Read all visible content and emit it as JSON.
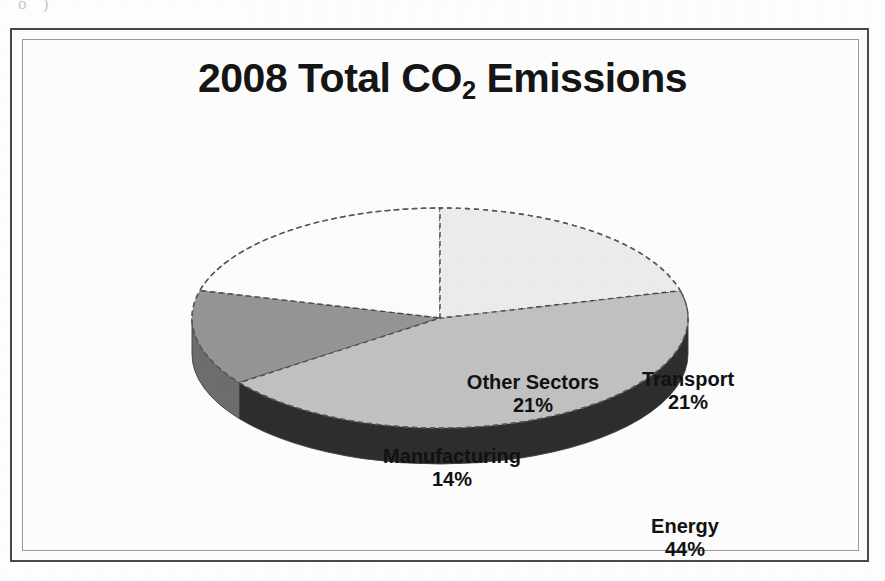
{
  "document": {
    "scan_artifact_top": "o          )"
  },
  "chart": {
    "title_main": "2008 Total CO",
    "title_sub": "2",
    "title_tail": " Emissions",
    "title_plain": "2008 Total CO2 Emissions"
  },
  "chart_data": {
    "type": "pie",
    "title": "2008 Total CO2 Emissions",
    "xlabel": "",
    "ylabel": "",
    "legend": "none",
    "grid": false,
    "three_d": true,
    "start_angle_deg": 0,
    "direction": "clockwise",
    "categories": [
      "Transport",
      "Energy",
      "Manufacturing",
      "Other Sectors"
    ],
    "values": [
      21,
      44,
      14,
      21
    ],
    "unit": "%",
    "slices": [
      {
        "label": "Transport",
        "value": 21,
        "value_text": "21%",
        "color": "#ededed",
        "side_color": "#b4b4b4"
      },
      {
        "label": "Energy",
        "value": 44,
        "value_text": "44%",
        "color": "#c2c2c2",
        "side_color": "#2e2e2e"
      },
      {
        "label": "Manufacturing",
        "value": 14,
        "value_text": "14%",
        "color": "#969696",
        "side_color": "#6e6e6e"
      },
      {
        "label": "Other Sectors",
        "value": 21,
        "value_text": "21%",
        "color": "#fdfdfd",
        "side_color": "#9e9e9e"
      }
    ]
  },
  "labels": {
    "other_sectors": {
      "name": "Other Sectors",
      "value": "21%"
    },
    "transport": {
      "name": "Transport",
      "value": "21%"
    },
    "manufacturing": {
      "name": "Manufacturing",
      "value": "14%"
    },
    "energy": {
      "name": "Energy",
      "value": "44%"
    }
  },
  "colors": {
    "page_background": "#ffffff",
    "frame_outer": "#4a4a4a",
    "frame_inner": "#9a9a9a",
    "text": "#151515",
    "slice_transport": "#ededed",
    "slice_energy": "#c2c2c2",
    "slice_manufacturing": "#969696",
    "slice_other_sectors": "#fdfdfd",
    "wall_dark": "#2e2e2e",
    "wall_mid": "#6e6e6e"
  }
}
